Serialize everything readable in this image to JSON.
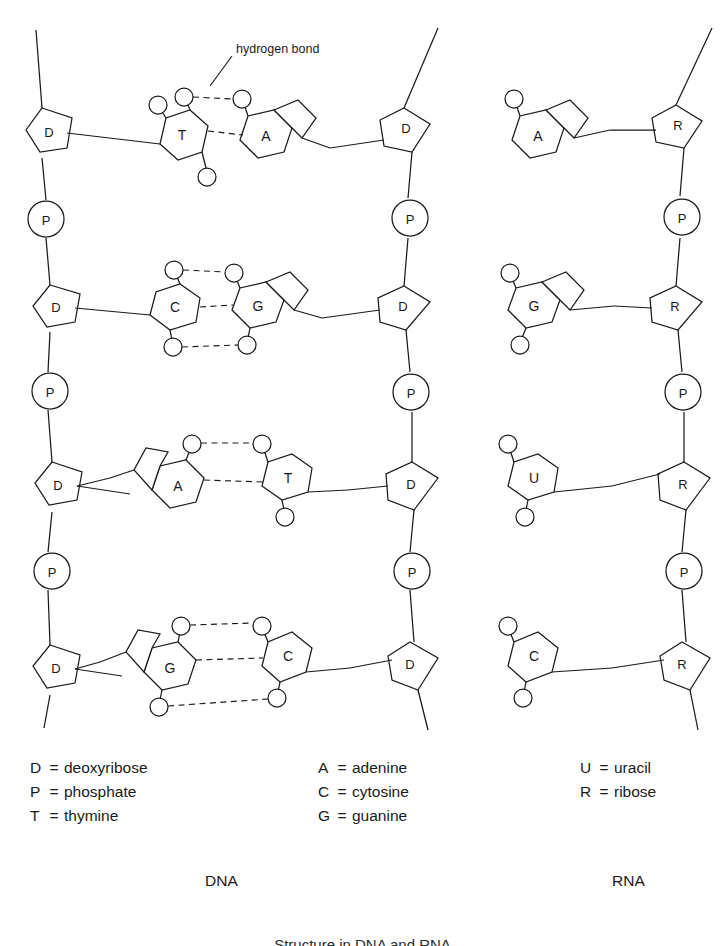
{
  "figure": {
    "caption": "Structure in DNA and RNA",
    "dna_title": "DNA",
    "rna_title": "RNA",
    "annotation": "hydrogen bond"
  },
  "legend": {
    "sugar_backbone": [
      {
        "symbol": "D",
        "equals": "=",
        "name": "deoxyribose"
      },
      {
        "symbol": "P",
        "equals": "=",
        "name": "phosphate"
      },
      {
        "symbol": "T",
        "equals": "=",
        "name": "thymine"
      }
    ],
    "bases": [
      {
        "symbol": "A",
        "equals": "=",
        "name": "adenine"
      },
      {
        "symbol": "C",
        "equals": "=",
        "name": "cytosine"
      },
      {
        "symbol": "G",
        "equals": "=",
        "name": "guanine"
      }
    ],
    "rna_only": [
      {
        "symbol": "U",
        "equals": "=",
        "name": "uracil"
      },
      {
        "symbol": "R",
        "equals": "=",
        "name": "ribose"
      }
    ]
  },
  "dna": {
    "left_backbone": [
      {
        "unit": "D",
        "kind": "sugar"
      },
      {
        "unit": "P",
        "kind": "phosphate"
      },
      {
        "unit": "D",
        "kind": "sugar"
      },
      {
        "unit": "P",
        "kind": "phosphate"
      },
      {
        "unit": "D",
        "kind": "sugar"
      },
      {
        "unit": "P",
        "kind": "phosphate"
      },
      {
        "unit": "D",
        "kind": "sugar"
      }
    ],
    "right_backbone": [
      {
        "unit": "D",
        "kind": "sugar"
      },
      {
        "unit": "P",
        "kind": "phosphate"
      },
      {
        "unit": "D",
        "kind": "sugar"
      },
      {
        "unit": "P",
        "kind": "phosphate"
      },
      {
        "unit": "D",
        "kind": "sugar"
      },
      {
        "unit": "P",
        "kind": "phosphate"
      },
      {
        "unit": "D",
        "kind": "sugar"
      }
    ],
    "base_pairs": [
      {
        "left": "T",
        "right": "A",
        "hydrogen_bonds": 2
      },
      {
        "left": "C",
        "right": "G",
        "hydrogen_bonds": 3
      },
      {
        "left": "A",
        "right": "T",
        "hydrogen_bonds": 2
      },
      {
        "left": "G",
        "right": "C",
        "hydrogen_bonds": 3
      }
    ]
  },
  "rna": {
    "backbone": [
      {
        "unit": "R",
        "kind": "sugar"
      },
      {
        "unit": "P",
        "kind": "phosphate"
      },
      {
        "unit": "R",
        "kind": "sugar"
      },
      {
        "unit": "P",
        "kind": "phosphate"
      },
      {
        "unit": "R",
        "kind": "sugar"
      },
      {
        "unit": "P",
        "kind": "phosphate"
      },
      {
        "unit": "R",
        "kind": "sugar"
      }
    ],
    "bases": [
      {
        "unit": "A",
        "type": "purine"
      },
      {
        "unit": "G",
        "type": "purine"
      },
      {
        "unit": "U",
        "type": "pyrimidine"
      },
      {
        "unit": "C",
        "type": "pyrimidine"
      }
    ]
  },
  "colors": {
    "ink": "#1a1a1a",
    "paper": "#ffffff"
  }
}
